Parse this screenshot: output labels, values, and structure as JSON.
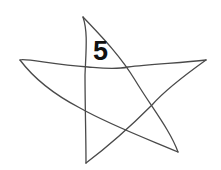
{
  "figure": {
    "shape": "hand-drawn five-pointed star",
    "label": "5",
    "stroke_color": "#4a4a4a",
    "label_color": "#111111",
    "background": "#ffffff"
  }
}
